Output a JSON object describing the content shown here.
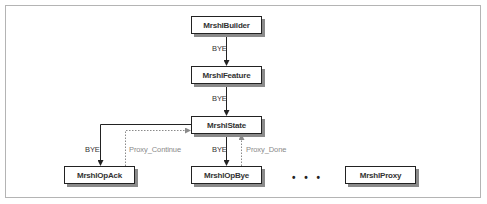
{
  "diagram": {
    "type": "class-chain-flow",
    "nodes": [
      {
        "id": "builder",
        "label": "MrshlBuilder"
      },
      {
        "id": "feature",
        "label": "MrshlFeature"
      },
      {
        "id": "state",
        "label": "MrshlState"
      },
      {
        "id": "opack",
        "label": "MrshlOpAck"
      },
      {
        "id": "opbye",
        "label": "MrshlOpBye"
      },
      {
        "id": "proxy",
        "label": "MrshlProxy"
      }
    ],
    "edges": [
      {
        "from": "builder",
        "to": "feature",
        "label": "BYE",
        "style": "solid"
      },
      {
        "from": "feature",
        "to": "state",
        "label": "BYE",
        "style": "solid"
      },
      {
        "from": "state",
        "to": "opack",
        "label": "BYE",
        "style": "solid"
      },
      {
        "from": "opack",
        "to": "state",
        "label": "Proxy_Continue",
        "style": "dashed"
      },
      {
        "from": "state",
        "to": "opbye",
        "label": "BYE",
        "style": "solid"
      },
      {
        "from": "opbye",
        "to": "state",
        "label": "Proxy_Done",
        "style": "dashed"
      }
    ],
    "ellipsis": "• • •",
    "colors": {
      "solid_edge": "#222222",
      "dashed_edge": "#8a8a8a",
      "node_border": "#222222",
      "node_shadow": "#8a8a8a",
      "frame": "#b4b4b4"
    }
  }
}
